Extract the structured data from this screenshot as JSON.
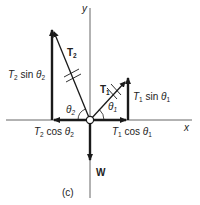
{
  "figure": {
    "caption": "(c)",
    "axes": {
      "x_label": "x",
      "y_label": "y"
    },
    "vectors": {
      "T1": {
        "label": "T",
        "sub": "1"
      },
      "T2": {
        "label": "T",
        "sub": "2"
      },
      "W": {
        "label": "W"
      }
    },
    "components": {
      "t2_sin": {
        "T": "T",
        "sub": "2",
        "fn": " sin ",
        "theta": "θ",
        "tsub": "2"
      },
      "t2_cos": {
        "T": "T",
        "sub": "2",
        "fn": " cos ",
        "theta": "θ",
        "tsub": "2"
      },
      "t1_sin": {
        "T": "T",
        "sub": "1",
        "fn": " sin ",
        "theta": "θ",
        "tsub": "1"
      },
      "t1_cos": {
        "T": "T",
        "sub": "1",
        "fn": " cos ",
        "theta": "θ",
        "tsub": "1"
      }
    },
    "angles": {
      "theta1": {
        "sym": "θ",
        "sub": "1"
      },
      "theta2": {
        "sym": "θ",
        "sub": "2"
      }
    },
    "colors": {
      "ink": "#1a1a1a",
      "axis": "#555555",
      "background": "#ffffff"
    }
  }
}
